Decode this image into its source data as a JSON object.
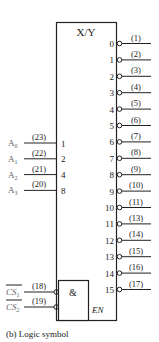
{
  "diagram": {
    "title": "X/Y",
    "outputs": [
      {
        "index": "0",
        "pin": "(1)"
      },
      {
        "index": "1",
        "pin": "(2)"
      },
      {
        "index": "2",
        "pin": "(3)"
      },
      {
        "index": "3",
        "pin": "(4)"
      },
      {
        "index": "4",
        "pin": "(5)"
      },
      {
        "index": "5",
        "pin": "(6)"
      },
      {
        "index": "6",
        "pin": "(7)"
      },
      {
        "index": "7",
        "pin": "(8)"
      },
      {
        "index": "8",
        "pin": "(9)"
      },
      {
        "index": "9",
        "pin": "(10)"
      },
      {
        "index": "10",
        "pin": "(11)"
      },
      {
        "index": "11",
        "pin": "(13)"
      },
      {
        "index": "12",
        "pin": "(14)"
      },
      {
        "index": "13",
        "pin": "(15)"
      },
      {
        "index": "14",
        "pin": "(16)"
      },
      {
        "index": "15",
        "pin": "(17)"
      }
    ],
    "address_inputs": [
      {
        "name": "A",
        "sub": "0",
        "pin": "(23)",
        "weight": "1"
      },
      {
        "name": "A",
        "sub": "1",
        "pin": "(22)",
        "weight": "2"
      },
      {
        "name": "A",
        "sub": "2",
        "pin": "(21)",
        "weight": "4"
      },
      {
        "name": "A",
        "sub": "3",
        "pin": "(20)",
        "weight": "8"
      }
    ],
    "enable_inputs": [
      {
        "name": "CS",
        "sub": "1",
        "pin": "(18)"
      },
      {
        "name": "CS",
        "sub": "2",
        "pin": "(19)"
      }
    ],
    "and_gate_label": "&",
    "enable_label": "EN",
    "caption": "(b)  Logic symbol"
  }
}
